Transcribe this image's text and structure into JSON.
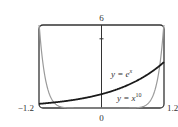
{
  "chart_data": {
    "type": "line",
    "title": "",
    "xlabel": "",
    "ylabel": "",
    "xlim": [
      -1.2,
      1.2
    ],
    "ylim": [
      0,
      6
    ],
    "grid": false,
    "x_ticks": [
      "-1.2",
      "0",
      "1.2"
    ],
    "y_ticks": [
      "6"
    ],
    "series": [
      {
        "name": "y = e^x",
        "label_main": "y = e",
        "label_sup": "x",
        "color": "#1a1a1a",
        "x": [
          -1.2,
          -0.8,
          -0.4,
          0,
          0.4,
          0.8,
          1.2
        ],
        "values": [
          0.3,
          0.45,
          0.67,
          1.0,
          1.49,
          2.23,
          3.32
        ]
      },
      {
        "name": "y = x^10",
        "label_main": "y = x",
        "label_sup": "10",
        "color": "#9a9a9a",
        "x": [
          -1.2,
          -1.1,
          -1.0,
          -0.9,
          -0.8,
          0,
          0.8,
          0.9,
          1.0,
          1.1,
          1.2
        ],
        "values": [
          6.19,
          2.59,
          1.0,
          0.35,
          0.11,
          0,
          0.11,
          0.35,
          1.0,
          2.59,
          6.19
        ]
      }
    ]
  },
  "labels": {
    "x_min": "−1.2",
    "x_zero": "0",
    "x_max": "1.2",
    "y_max": "6"
  }
}
